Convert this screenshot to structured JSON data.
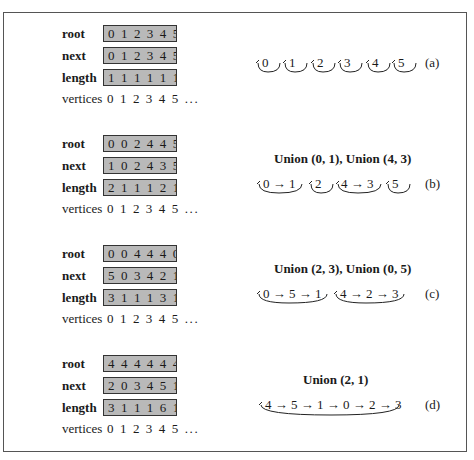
{
  "row_labels": {
    "root": "root",
    "next": "next",
    "length": "length",
    "vertices": "vertices"
  },
  "panels": [
    {
      "id": "a",
      "tag": "(a)",
      "title": "",
      "root": "0 1 2 3 4 5 ...",
      "next": "0 1 2 3 4 5 ...",
      "length": "1 1 1 1 1 1 ...",
      "vertices": "0 1 2 3 4 5 ...",
      "chains": [
        "0",
        "1",
        "2",
        "3",
        "4",
        "5"
      ]
    },
    {
      "id": "b",
      "tag": "(b)",
      "title": "Union (0, 1), Union (4, 3)",
      "root": "0 0 2 4 4 5 ...",
      "next": "1 0 2 4 3 5 ...",
      "length": "2 1 1 1 2 1 ...",
      "vertices": "0 1 2 3 4 5 ...",
      "chains": [
        "0 → 1",
        "2",
        "4 → 3",
        "5"
      ]
    },
    {
      "id": "c",
      "tag": "(c)",
      "title": "Union (2, 3), Union (0, 5)",
      "root": "0 0 4 4 4 0 ...",
      "next": "5 0 3 4 2 1 ...",
      "length": "3 1 1 1 3 1 ...",
      "vertices": "0 1 2 3 4 5 ...",
      "chains": [
        "0 → 5 → 1",
        "4 → 2 → 3"
      ]
    },
    {
      "id": "d",
      "tag": "(d)",
      "title": "Union (2, 1)",
      "root": "4 4 4 4 4 4 ...",
      "next": "2 0 3 4 5 1 ...",
      "length": "3 1 1 1 6 1 ...",
      "vertices": "0 1 2 3 4 5 ...",
      "chains": [
        "4 → 5 → 1 → 0 → 2 → 3"
      ]
    }
  ],
  "colors": {
    "box_fill": "#b9b9b9",
    "box_border": "#333333",
    "frame": "#555555"
  }
}
